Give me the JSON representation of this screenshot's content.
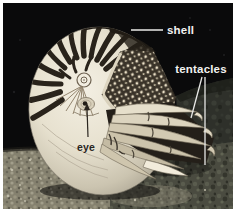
{
  "figure": {
    "caption_labels": {
      "shell": "shell",
      "tentacles": "tentacles",
      "eye": "eye"
    },
    "colors": {
      "page_background": "#ffffff",
      "water_black": "#0a0a0b",
      "label_light": "#f2f2f0",
      "label_dark": "#2a251f",
      "leader_light": "#e8e8e6",
      "leader_dark": "#2a251f",
      "shell_cream": "#e9e3d1",
      "shell_stripe": "#29231b",
      "hood_dark": "#3a3329",
      "seafloor_gray": "#85816f"
    }
  }
}
